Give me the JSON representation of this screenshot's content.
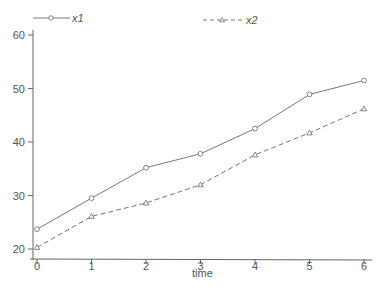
{
  "chart_data": {
    "type": "line",
    "title": "",
    "xlabel": "time",
    "ylabel": "",
    "x": [
      0,
      1,
      2,
      3,
      4,
      5,
      6
    ],
    "series": [
      {
        "name": "x1",
        "line_style": "solid",
        "marker": "circle",
        "color": "#777777",
        "values": [
          23.7,
          29.5,
          35.2,
          37.8,
          42.5,
          48.9,
          51.5
        ]
      },
      {
        "name": "x2",
        "line_style": "dashed",
        "marker": "triangle",
        "color": "#777777",
        "values": [
          20.3,
          26.1,
          28.6,
          32.0,
          37.6,
          41.7,
          46.2
        ]
      }
    ],
    "xticks": [
      0,
      1,
      2,
      3,
      4,
      5,
      6
    ],
    "yticks": [
      20,
      30,
      40,
      50,
      60
    ],
    "xlim": [
      0,
      6
    ],
    "ylim": [
      19,
      62
    ],
    "grid": false,
    "legend_position": "top"
  },
  "legend": {
    "x1_label": "x1",
    "x2_label": "x2"
  },
  "axes": {
    "x_title": "time",
    "x_tick_labels": [
      "0",
      "1",
      "2",
      "3",
      "4",
      "5",
      "6"
    ],
    "y_tick_labels": [
      "20",
      "30",
      "40",
      "50",
      "60"
    ]
  }
}
